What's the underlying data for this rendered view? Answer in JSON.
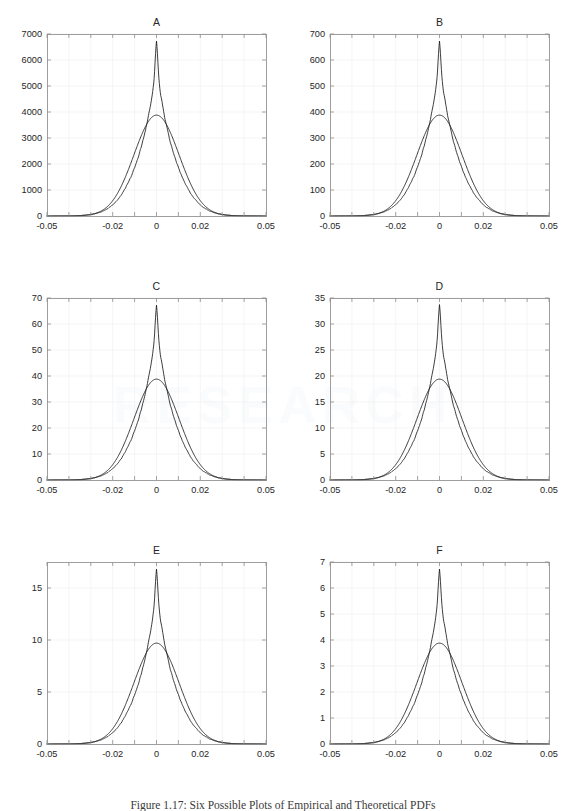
{
  "figure": {
    "caption": "Figure 1.17: Six Possible Plots of Empirical and Theoretical PDFs",
    "panel_count": 6,
    "columns": 2,
    "rows": 3,
    "background_color": "#ffffff",
    "line_color": "#1a1a1a",
    "axis_color": "#8d8d8d",
    "grid_color": "#f0f0f0"
  },
  "chart_data": [
    {
      "type": "line",
      "title": "A",
      "xlabel": "",
      "ylabel": "",
      "xlim": [
        -0.05,
        0.05
      ],
      "ylim": [
        0,
        7000
      ],
      "xticks": [
        -0.05,
        -0.02,
        0,
        0.02,
        0.05
      ],
      "xticklabels": [
        "-0.05",
        "-0.02",
        "0",
        "0.02",
        "0.05"
      ],
      "yticks": [
        0,
        1000,
        2000,
        3000,
        4000,
        5000,
        6000,
        7000
      ],
      "yticklabels": [
        "0",
        "1000",
        "2000",
        "3000",
        "4000",
        "5000",
        "6000",
        "7000"
      ],
      "grid": true,
      "legend": "none",
      "series": [
        {
          "name": "Empirical PDF",
          "style": "jagged",
          "peak_x": 0.0,
          "peak_y": 6700,
          "shoulder_y": 5800,
          "scale": 3880,
          "sigma": 0.0103,
          "laplace_b": 0.0062,
          "noise_amplitude": 0.035
        },
        {
          "name": "Theoretical Normal PDF",
          "style": "smooth",
          "peak_x": 0.0,
          "peak_y": 3880,
          "scale": 3880,
          "sigma": 0.0103
        }
      ]
    },
    {
      "type": "line",
      "title": "B",
      "xlabel": "",
      "ylabel": "",
      "xlim": [
        -0.05,
        0.05
      ],
      "ylim": [
        0,
        700
      ],
      "xticks": [
        -0.05,
        -0.02,
        0,
        0.02,
        0.05
      ],
      "xticklabels": [
        "-0.05",
        "-0.02",
        "0",
        "0.02",
        "0.05"
      ],
      "yticks": [
        0,
        100,
        200,
        300,
        400,
        500,
        600,
        700
      ],
      "yticklabels": [
        "0",
        "100",
        "200",
        "300",
        "400",
        "500",
        "600",
        "700"
      ],
      "grid": true,
      "legend": "none",
      "series": [
        {
          "name": "Empirical PDF",
          "style": "jagged",
          "peak_x": 0.0,
          "peak_y": 670,
          "shoulder_y": 590,
          "scale": 388,
          "sigma": 0.0103,
          "laplace_b": 0.0062,
          "noise_amplitude": 0.035
        },
        {
          "name": "Theoretical Normal PDF",
          "style": "smooth",
          "peak_x": 0.0,
          "peak_y": 388,
          "scale": 388,
          "sigma": 0.0103
        }
      ]
    },
    {
      "type": "line",
      "title": "C",
      "xlabel": "",
      "ylabel": "",
      "xlim": [
        -0.05,
        0.05
      ],
      "ylim": [
        0,
        70
      ],
      "xticks": [
        -0.05,
        -0.02,
        0,
        0.02,
        0.05
      ],
      "xticklabels": [
        "-0.05",
        "-0.02",
        "0",
        "0.02",
        "0.05"
      ],
      "yticks": [
        0,
        10,
        20,
        30,
        40,
        50,
        60,
        70
      ],
      "yticklabels": [
        "0",
        "10",
        "20",
        "30",
        "40",
        "50",
        "60",
        "70"
      ],
      "grid": true,
      "legend": "none",
      "series": [
        {
          "name": "Empirical PDF",
          "style": "jagged",
          "peak_x": 0.0,
          "peak_y": 67,
          "shoulder_y": 59,
          "scale": 38.8,
          "sigma": 0.0103,
          "laplace_b": 0.0062,
          "noise_amplitude": 0.035
        },
        {
          "name": "Theoretical Normal PDF",
          "style": "smooth",
          "peak_x": 0.0,
          "peak_y": 38.8,
          "scale": 38.8,
          "sigma": 0.0103
        }
      ]
    },
    {
      "type": "line",
      "title": "D",
      "xlabel": "",
      "ylabel": "",
      "xlim": [
        -0.05,
        0.05
      ],
      "ylim": [
        0,
        35
      ],
      "xticks": [
        -0.05,
        -0.02,
        0,
        0.02,
        0.05
      ],
      "xticklabels": [
        "-0.05",
        "-0.02",
        "0",
        "0.02",
        "0.05"
      ],
      "yticks": [
        0,
        5,
        10,
        15,
        20,
        25,
        30,
        35
      ],
      "yticklabels": [
        "0",
        "5",
        "10",
        "15",
        "20",
        "25",
        "30",
        "35"
      ],
      "grid": true,
      "legend": "none",
      "series": [
        {
          "name": "Empirical PDF",
          "style": "jagged",
          "peak_x": 0.0,
          "peak_y": 33.6,
          "shoulder_y": 29.5,
          "scale": 19.4,
          "sigma": 0.0103,
          "laplace_b": 0.0062,
          "noise_amplitude": 0.035
        },
        {
          "name": "Theoretical Normal PDF",
          "style": "smooth",
          "peak_x": 0.0,
          "peak_y": 19.4,
          "scale": 19.4,
          "sigma": 0.0103
        }
      ]
    },
    {
      "type": "line",
      "title": "E",
      "xlabel": "",
      "ylabel": "",
      "xlim": [
        -0.05,
        0.05
      ],
      "ylim": [
        0,
        17.5
      ],
      "xticks": [
        -0.05,
        -0.02,
        0,
        0.02,
        0.05
      ],
      "xticklabels": [
        "-0.05",
        "-0.02",
        "0",
        "0.02",
        "0.05"
      ],
      "yticks": [
        0,
        5,
        10,
        15
      ],
      "yticklabels": [
        "0",
        "5",
        "10",
        "15"
      ],
      "grid": true,
      "legend": "none",
      "series": [
        {
          "name": "Empirical PDF",
          "style": "jagged",
          "peak_x": 0.0,
          "peak_y": 16.75,
          "shoulder_y": 14.7,
          "scale": 9.7,
          "sigma": 0.0103,
          "laplace_b": 0.0062,
          "noise_amplitude": 0.035
        },
        {
          "name": "Theoretical Normal PDF",
          "style": "smooth",
          "peak_x": 0.0,
          "peak_y": 9.7,
          "scale": 9.7,
          "sigma": 0.0103
        }
      ]
    },
    {
      "type": "line",
      "title": "F",
      "xlabel": "",
      "ylabel": "",
      "xlim": [
        -0.05,
        0.05
      ],
      "ylim": [
        0,
        7
      ],
      "xticks": [
        -0.05,
        -0.02,
        0,
        0.02,
        0.05
      ],
      "xticklabels": [
        "-0.05",
        "-0.02",
        "0",
        "0.02",
        "0.05"
      ],
      "yticks": [
        0,
        1,
        2,
        3,
        4,
        5,
        6,
        7
      ],
      "yticklabels": [
        "0",
        "1",
        "2",
        "3",
        "4",
        "5",
        "6",
        "7"
      ],
      "grid": true,
      "legend": "none",
      "series": [
        {
          "name": "Empirical PDF",
          "style": "jagged",
          "peak_x": 0.0,
          "peak_y": 6.7,
          "shoulder_y": 5.9,
          "scale": 3.88,
          "sigma": 0.0103,
          "laplace_b": 0.0062,
          "noise_amplitude": 0.035
        },
        {
          "name": "Theoretical Normal PDF",
          "style": "smooth",
          "peak_x": 0.0,
          "peak_y": 3.88,
          "scale": 3.88,
          "sigma": 0.0103
        }
      ]
    }
  ]
}
